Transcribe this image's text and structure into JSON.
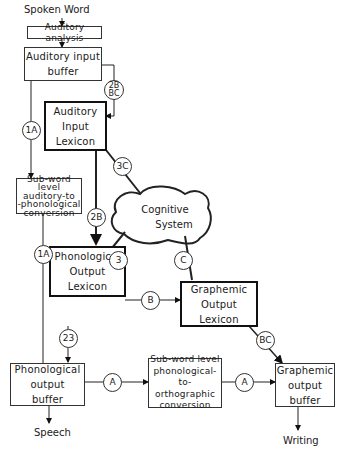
{
  "diagram": {
    "type": "cognitive-neuropsychology-model",
    "input_label": "Spoken Word",
    "outputs": {
      "speech": "Speech",
      "writing": "Writing"
    },
    "nodes": {
      "auditory_analysis": "Auditory analysis",
      "auditory_input_buffer": {
        "line1": "Auditory input",
        "line2": "buffer"
      },
      "auditory_input_lexicon": {
        "line1": "Auditory",
        "line2": "Input",
        "line3": "Lexicon"
      },
      "subword_auditory_to_phonological": {
        "line1": "Sub-word level",
        "line2": "auditory-to",
        "line3": "-phonological",
        "line4": "conversion"
      },
      "cognitive_system": {
        "line1": "Cognitive",
        "line2": "System"
      },
      "phonological_output_lexicon": {
        "line1": "Phonological",
        "line2": "Output",
        "line3": "Lexicon"
      },
      "graphemic_output_lexicon": {
        "line1": "Graphemic",
        "line2": "Output",
        "line3": "Lexicon"
      },
      "phonological_output_buffer": {
        "line1": "Phonological",
        "line2": "output",
        "line3": "buffer"
      },
      "subword_phonological_to_orthographic": {
        "line1": "Sub-word level",
        "line2": "phonological-to-",
        "line3": "orthographic",
        "line4": "conversion"
      },
      "graphemic_output_buffer": {
        "line1": "Graphemic",
        "line2": "output",
        "line3": "buffer"
      }
    },
    "route_labels": {
      "buffer_to_lexicon": {
        "line1": "2B",
        "line2": "BC"
      },
      "buffer_to_subword": "1A",
      "lexicon_to_cognitive": "3C",
      "lexicon_to_phon_lexicon": "2B",
      "subword_to_phon_buffer": "1A",
      "cognitive_to_phon_lexicon": "3",
      "cognitive_to_graph_lexicon": "C",
      "phon_lexicon_to_graph_lexicon": "B",
      "phon_lexicon_to_phon_buffer": "23",
      "graph_lexicon_to_graph_buffer": "BC",
      "phon_buffer_to_subword_p2o": "A",
      "subword_p2o_to_graph_buffer": "A"
    }
  }
}
